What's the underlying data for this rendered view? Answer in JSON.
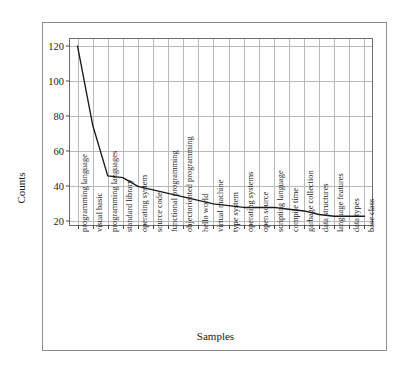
{
  "page": {
    "top_strip_ghost_text": "—  ——  —  —  ——  ———  ——  ———  —  ——  ——  —"
  },
  "chart_data": {
    "type": "line",
    "title": "",
    "xlabel": "Samples",
    "ylabel": "Counts",
    "ylim": [
      18,
      124
    ],
    "yticks": [
      20,
      40,
      60,
      80,
      100,
      120
    ],
    "grid": true,
    "legend": "none",
    "line_color": "#1a1a1a",
    "grid_color": "#b9b9b9",
    "axis_color": "#6d6d6d",
    "categories": [
      "programming language",
      "visual basic",
      "programming languages",
      "standard library",
      "operating system",
      "source code",
      "functional programming",
      "objectoriented programming",
      "hello world",
      "virtual machine",
      "type system",
      "operating systems",
      "open source",
      "scripting language",
      "compile time",
      "garbage collection",
      "data structures",
      "language features",
      "data types",
      "base class"
    ],
    "values": [
      120,
      75,
      46,
      45,
      40,
      38,
      36,
      34,
      32,
      30,
      29,
      28,
      28,
      28,
      27,
      26,
      24,
      23,
      23,
      23
    ]
  }
}
